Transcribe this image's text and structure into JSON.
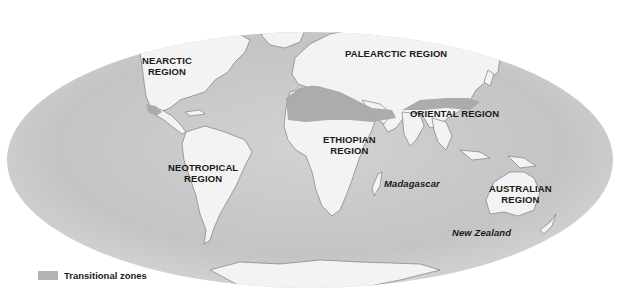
{
  "map": {
    "title": "Zoogeographic regions of the world",
    "projection": "elliptical (Mollweide-like) world map",
    "colors": {
      "ocean": "#c9c9c9",
      "land": "#f3f3f3",
      "transitional": "#a9a9a9",
      "background": "#ffffff",
      "text": "#1a1a1a"
    },
    "regions": [
      {
        "id": "nearctic",
        "line1": "NEARCTIC",
        "line2": "REGION"
      },
      {
        "id": "palearctic",
        "line1": "PALEARCTIC REGION",
        "line2": ""
      },
      {
        "id": "oriental",
        "line1": "ORIENTAL REGION",
        "line2": ""
      },
      {
        "id": "ethiopian",
        "line1": "ETHIOPIAN",
        "line2": "REGION"
      },
      {
        "id": "neotropical",
        "line1": "NEOTROPICAL",
        "line2": "REGION"
      },
      {
        "id": "australian",
        "line1": "AUSTRALIAN",
        "line2": "REGION"
      }
    ],
    "places": [
      {
        "id": "madagascar",
        "label": "Madagascar"
      },
      {
        "id": "new-zealand",
        "label": "New Zealand"
      }
    ]
  },
  "legend": {
    "items": [
      {
        "label": "Transitional zones",
        "color": "#b4b4b4"
      }
    ]
  }
}
